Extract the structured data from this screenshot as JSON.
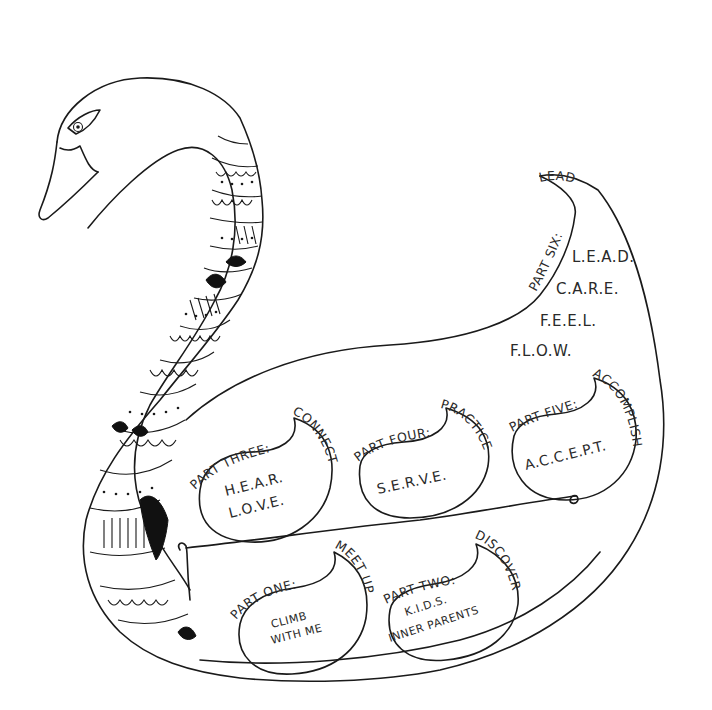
{
  "illustration": {
    "subject": "swan roadmap",
    "stroke_color": "#1a1a1a",
    "background": "#ffffff"
  },
  "top_label": "LEAD",
  "part_six": {
    "heading": "PART SIX:",
    "items": [
      "L.E.A.D.",
      "C.A.R.E.",
      "F.E.E.L.",
      "F.L.O.W."
    ]
  },
  "parts": [
    {
      "id": "part-one",
      "heading": "PART ONE:",
      "theme": "MEET UP",
      "lines": [
        "CLIMB",
        "WITH ME"
      ]
    },
    {
      "id": "part-two",
      "heading": "PART TWO:",
      "theme": "DISCOVER",
      "lines": [
        "K.I.D.S.",
        "INNER PARENTS"
      ]
    },
    {
      "id": "part-three",
      "heading": "PART THREE:",
      "theme": "CONNECT",
      "lines": [
        "H.E.A.R.",
        "L.O.V.E."
      ]
    },
    {
      "id": "part-four",
      "heading": "PART FOUR:",
      "theme": "PRACTICE",
      "lines": [
        "S.E.R.V.E."
      ]
    },
    {
      "id": "part-five",
      "heading": "PART FIVE:",
      "theme": "ACCOMPLISH",
      "lines": [
        "A.C.C.E.P.T."
      ]
    }
  ]
}
